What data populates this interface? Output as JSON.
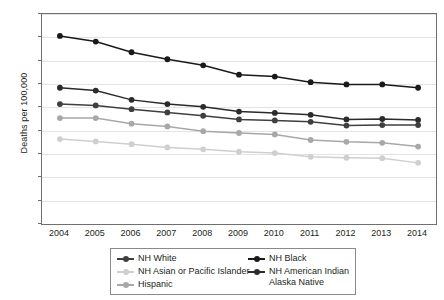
{
  "chart_data": {
    "type": "line",
    "title": "",
    "xlabel": "",
    "ylabel": "Deaths per 100,000",
    "ylim": [
      0,
      450
    ],
    "ytick_step": 50,
    "yticks": [
      "0",
      "50",
      "100",
      "150",
      "200",
      "250",
      "300",
      "350",
      "400",
      "450"
    ],
    "grid": true,
    "legend_position": "bottom",
    "categories": [
      "2004",
      "2005",
      "2006",
      "2007",
      "2008",
      "2009",
      "2010",
      "2011",
      "2012",
      "2013",
      "2014"
    ],
    "series": [
      {
        "name": "NH White",
        "color": "#3f3f3f",
        "values": [
          257,
          254,
          246,
          239,
          232,
          224,
          222,
          219,
          211,
          212,
          212
        ]
      },
      {
        "name": "NH Black",
        "color": "#1a1a1a",
        "values": [
          403,
          391,
          368,
          353,
          340,
          320,
          316,
          304,
          299,
          299,
          292
        ]
      },
      {
        "name": "NH Asian or Pacific Islander",
        "color": "#cfcfcf",
        "values": [
          182,
          177,
          171,
          164,
          160,
          155,
          152,
          144,
          142,
          141,
          131
        ]
      },
      {
        "name": "NH American Indian Alaska Native",
        "color": "#2b2b2b",
        "values": [
          292,
          286,
          266,
          257,
          251,
          241,
          238,
          234,
          224,
          225,
          223
        ]
      },
      {
        "name": "Hispanic",
        "color": "#a8a8a8",
        "values": [
          227,
          227,
          215,
          209,
          199,
          195,
          192,
          180,
          176,
          174,
          166
        ]
      }
    ],
    "legend": [
      {
        "label": "NH White",
        "color": "#3f3f3f"
      },
      {
        "label": "NH Black",
        "color": "#1a1a1a"
      },
      {
        "label": "NH Asian or Pacific Islander",
        "color": "#cfcfcf"
      },
      {
        "label": "NH American Indian",
        "label2": "Alaska Native",
        "color": "#2b2b2b"
      },
      {
        "label": "Hispanic",
        "color": "#a8a8a8"
      }
    ]
  }
}
